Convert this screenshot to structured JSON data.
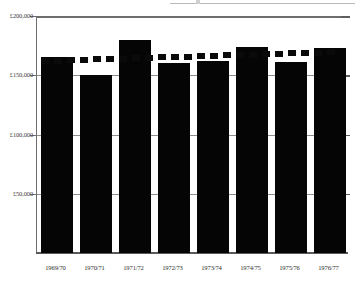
{
  "chart_data": {
    "type": "bar",
    "title": "",
    "subtitle": "",
    "xlabel": "",
    "ylabel": "",
    "categories": [
      "1969/70",
      "1970/71",
      "1971/72",
      "1972/73",
      "1973/74",
      "1974/75",
      "1975/76",
      "1976/77"
    ],
    "values": [
      165000,
      150000,
      180000,
      160000,
      162000,
      174000,
      161000,
      173000
    ],
    "series": [
      {
        "name": "Annual value",
        "type": "bar",
        "values": [
          165000,
          150000,
          180000,
          160000,
          162000,
          174000,
          161000,
          173000
        ]
      },
      {
        "name": "Trend",
        "type": "line",
        "style": "dotted",
        "values": [
          162000,
          163000,
          164000,
          165000,
          166000,
          168000,
          169000,
          170000
        ]
      }
    ],
    "ylim": [
      0,
      200000
    ],
    "yticks": [
      50000,
      100000,
      150000,
      200000
    ],
    "ytick_labels": [
      "£50,000",
      "£100,000",
      "£150,000",
      "£200,000"
    ],
    "currency": "GBP",
    "currency_symbol": "£",
    "grid": true,
    "grid_axis": "y",
    "legend": false,
    "bar_color": "#050505",
    "trend_color": "#0a0a0a",
    "axis_color": "#6e6e6e",
    "grid_color": "#8d8d8d",
    "background": "#ffffff"
  },
  "axes": {
    "y_labels": [
      "£200,000",
      "£150,000",
      "£100,000",
      "£50,000"
    ],
    "x_labels": [
      "1969/70",
      "1970/71",
      "1971/72",
      "1972/73",
      "1973/74",
      "1974/75",
      "1975/76",
      "1976/77"
    ]
  }
}
